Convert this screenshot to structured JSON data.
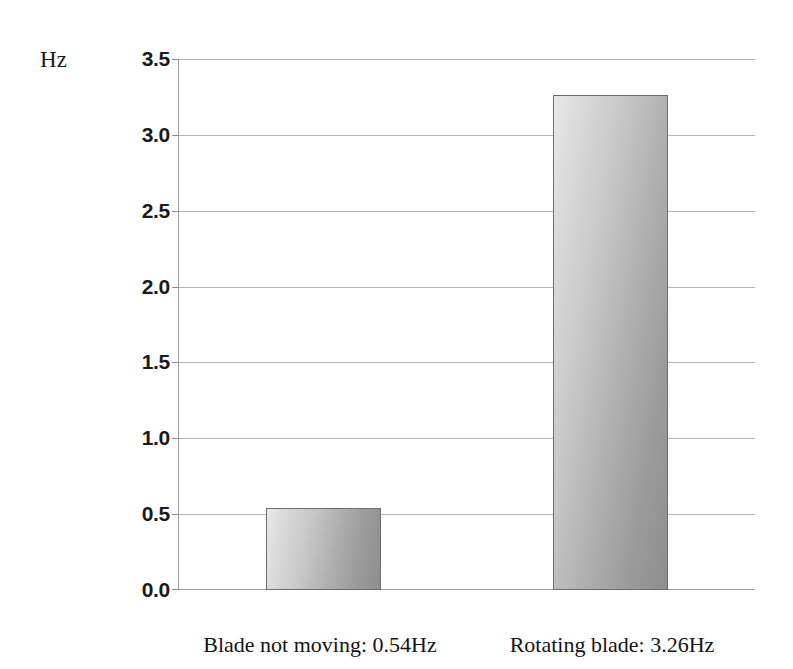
{
  "chart_data": {
    "type": "bar",
    "title": "",
    "xlabel": "",
    "ylabel": "Hz",
    "unit_label": "Hz",
    "categories": [
      "Blade not moving: 0.54Hz",
      "Rotating blade: 3.26Hz"
    ],
    "values": [
      0.54,
      3.26
    ],
    "ylim": [
      0.0,
      3.5
    ],
    "ytick_labels": [
      "0.0",
      "0.5",
      "1.0",
      "1.5",
      "2.0",
      "2.5",
      "3.0",
      "3.5"
    ],
    "ytick_values": [
      0.0,
      0.5,
      1.0,
      1.5,
      2.0,
      2.5,
      3.0,
      3.5
    ],
    "grid": true,
    "legend": "none",
    "bar_fill_start": "#e9e9e9",
    "bar_fill_end": "#8e8e8e",
    "bar_border_color": "#6e6e6e",
    "gridline_color": "#b4b4b4",
    "axis_color": "#9a9a9a",
    "background": "#ffffff"
  },
  "axis": {
    "unit": "Hz"
  },
  "bars": [
    {
      "label": "Blade not moving: 0.54Hz",
      "value": "0.54"
    },
    {
      "label": "Rotating blade: 3.26Hz",
      "value": "3.26"
    }
  ]
}
